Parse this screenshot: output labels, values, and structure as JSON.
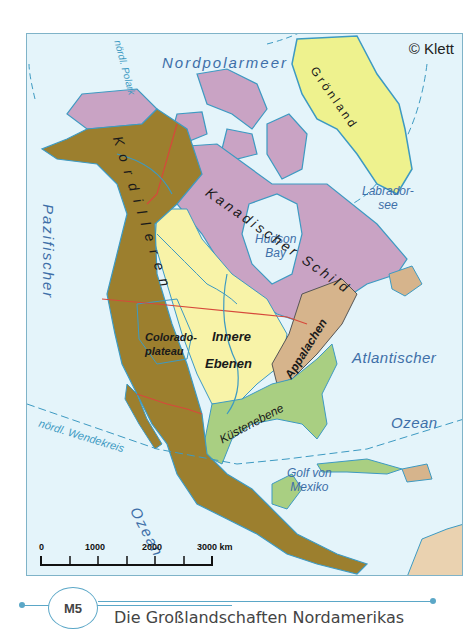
{
  "map": {
    "copyright": "© Klett",
    "oceans": {
      "arctic": "Nordpolarmeer",
      "pacific_line1": "Pazifischer",
      "pacific_line2": "Ozean",
      "atlantic_line1": "Atlantischer",
      "atlantic_line2": "Ozean"
    },
    "water_bodies": {
      "hudson": "Hudson Bay",
      "hudson_l1": "Hudson",
      "hudson_l2": "Bay",
      "labrador_l1": "Labrador-",
      "labrador_l2": "see",
      "gulf_l1": "Golf von",
      "gulf_l2": "Mexiko"
    },
    "regions": {
      "greenland": "Grönland",
      "cordillera": "Kordilleren",
      "shield": "Kanadischer Schild",
      "plains_l1": "Innere",
      "plains_l2": "Ebenen",
      "appalachian": "Appalachen",
      "coastal": "Küstenebene",
      "colorado_l1": "Colorado-",
      "colorado_l2": "plateau"
    },
    "lines": {
      "arctic_circle": "nördl. Polarkreis",
      "arctic_circle_visible": "nördl. Polark",
      "tropic": "nördl. Wendekreis"
    },
    "legend_colors": {
      "cordillera": "#9c7f2e",
      "shield": "#c9a3c4",
      "plains": "#f8f3a8",
      "appalachian": "#d6b48c",
      "coastal": "#a9cf82",
      "greenland": "#eef28e",
      "ocean": "#e4f4fa",
      "border": "#d6493b",
      "river": "#3d9ac2"
    },
    "scale_bar": {
      "ticks": [
        "0",
        "1000",
        "2000",
        "3000 km"
      ],
      "unit": "km"
    }
  },
  "caption": {
    "badge": "M5",
    "title": "Die Großlandschaften Nordamerikas"
  }
}
